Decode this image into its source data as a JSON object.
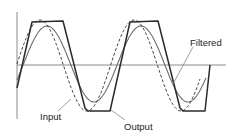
{
  "diagram": {
    "title": "",
    "labels": {
      "filtered": "Filtered",
      "input": "Input",
      "output": "Output"
    },
    "colors": {
      "axis": "#8a8a8a",
      "input": "#444444",
      "output": "#2a2a2a",
      "filtered": "#6e6e6e",
      "leader": "#888888",
      "text": "#222222"
    },
    "series": [
      {
        "name": "Input",
        "style": "dashed",
        "shape": "sine",
        "phase": "leading"
      },
      {
        "name": "Output",
        "style": "solid-thick",
        "shape": "clipped-trapezoid"
      },
      {
        "name": "Filtered",
        "style": "solid-thin",
        "shape": "sine",
        "phase": "lagging"
      }
    ],
    "cycles_shown": 2.2
  }
}
